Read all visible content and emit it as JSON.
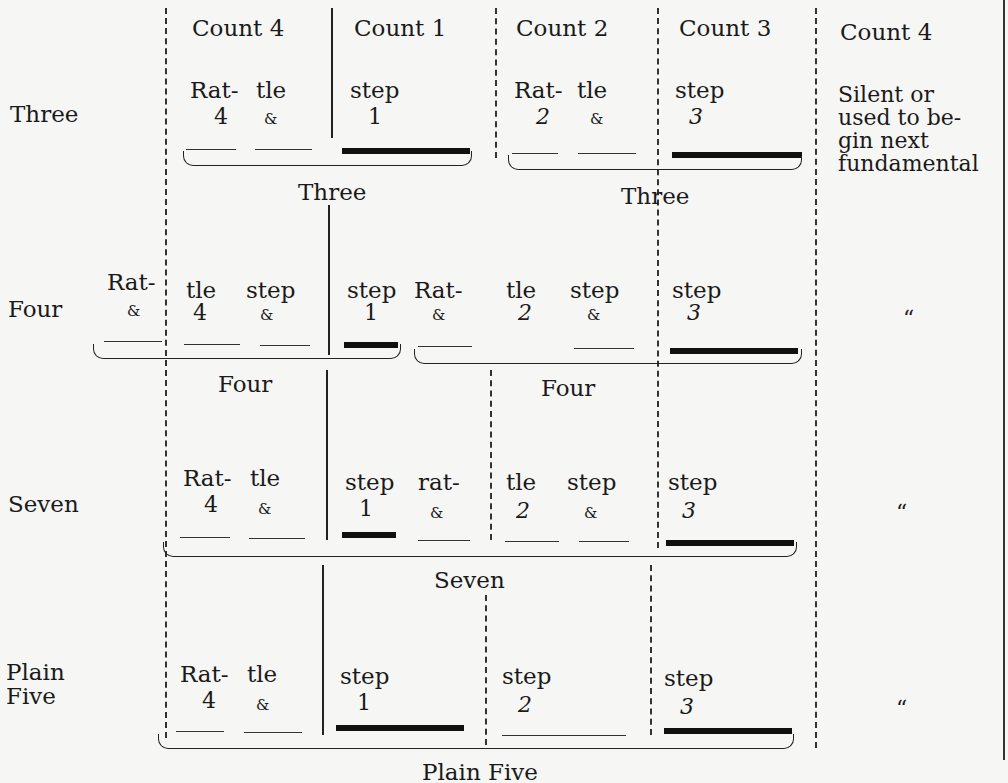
{
  "headers": [
    "Count 4",
    "Count 1",
    "Count 2",
    "Count 3",
    "Count 4"
  ],
  "note": [
    "Silent or",
    "used to be-",
    "gin next",
    "fundamental"
  ],
  "ditto": "“",
  "rows": [
    {
      "label": [
        "Three"
      ],
      "brace_labels": [
        "Three",
        "Three"
      ],
      "cells": [
        {
          "syl": "Rat-",
          "cnt": "4"
        },
        {
          "syl": "tle",
          "cnt": "&"
        },
        {
          "syl": "step",
          "cnt": "1"
        },
        {
          "syl": "Rat-",
          "cnt": "2"
        },
        {
          "syl": "tle",
          "cnt": "&"
        },
        {
          "syl": "step",
          "cnt": "3"
        }
      ]
    },
    {
      "label": [
        "Four"
      ],
      "brace_labels": [
        "Four",
        "Four"
      ],
      "cells": [
        {
          "syl": "Rat-",
          "cnt": "&"
        },
        {
          "syl": "tle",
          "cnt": "4"
        },
        {
          "syl": "step",
          "cnt": "&"
        },
        {
          "syl": "step",
          "cnt": "1"
        },
        {
          "syl": "Rat-",
          "cnt": "&"
        },
        {
          "syl": "tle",
          "cnt": "2"
        },
        {
          "syl": "step",
          "cnt": "&"
        },
        {
          "syl": "step",
          "cnt": "3"
        }
      ]
    },
    {
      "label": [
        "Seven"
      ],
      "brace_labels": [
        "Seven"
      ],
      "cells": [
        {
          "syl": "Rat-",
          "cnt": "4"
        },
        {
          "syl": "tle",
          "cnt": "&"
        },
        {
          "syl": "step",
          "cnt": "1"
        },
        {
          "syl": "rat-",
          "cnt": "&"
        },
        {
          "syl": "tle",
          "cnt": "2"
        },
        {
          "syl": "step",
          "cnt": "&"
        },
        {
          "syl": "step",
          "cnt": "3"
        }
      ]
    },
    {
      "label": [
        "Plain",
        "Five"
      ],
      "brace_labels": [
        "Plain Five"
      ],
      "cells": [
        {
          "syl": "Rat-",
          "cnt": "4"
        },
        {
          "syl": "tle",
          "cnt": "&"
        },
        {
          "syl": "step",
          "cnt": "1"
        },
        {
          "syl": "step",
          "cnt": "2"
        },
        {
          "syl": "step",
          "cnt": "3"
        }
      ]
    }
  ]
}
